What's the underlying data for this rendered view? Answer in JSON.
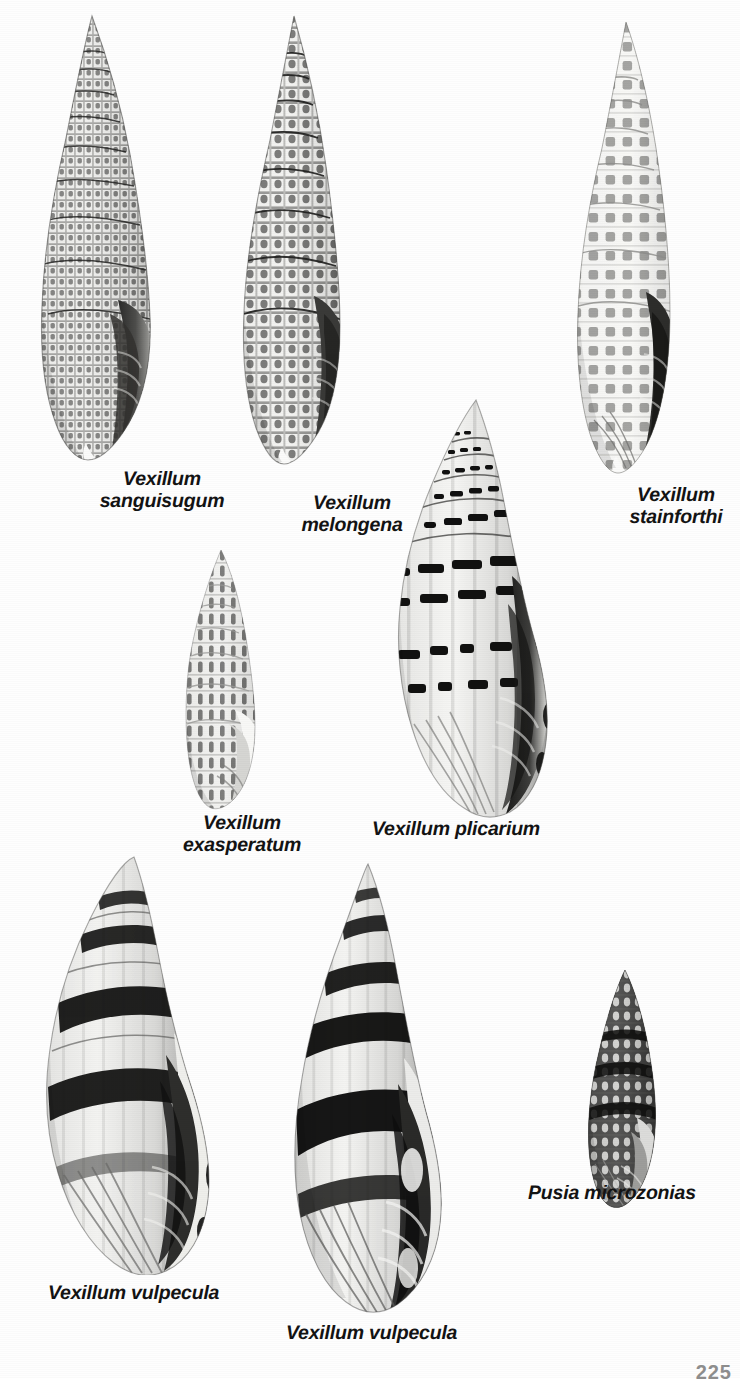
{
  "plate": {
    "background_color": "#fefefe",
    "ink_color": "#131313",
    "page_number": "225",
    "kind": "illustrated-plate"
  },
  "specimens": [
    {
      "id": "vexillum-sanguisugum",
      "caption": "Vexillum\nsanguisugum",
      "genus": "Vexillum",
      "species": "sanguisugum",
      "pattern": "fine-cancellate-grid",
      "shape": "elongate-fusiform",
      "x": 14,
      "y": 14,
      "w": 175,
      "h": 448,
      "caption_x": 62,
      "caption_y": 468,
      "caption_w": 200
    },
    {
      "id": "vexillum-melongena",
      "caption": "Vexillum\nmelongena",
      "genus": "Vexillum",
      "species": "melongena",
      "pattern": "bold-checker-spiral",
      "shape": "elongate-fusiform",
      "x": 218,
      "y": 14,
      "w": 160,
      "h": 452,
      "caption_x": 252,
      "caption_y": 492,
      "caption_w": 200
    },
    {
      "id": "vexillum-stainforthi",
      "caption": "Vexillum\nstainforthi",
      "genus": "Vexillum",
      "species": "stainforthi",
      "pattern": "rectangular-blotches",
      "shape": "slender-turreted",
      "x": 552,
      "y": 20,
      "w": 158,
      "h": 455,
      "caption_x": 576,
      "caption_y": 484,
      "caption_w": 200
    },
    {
      "id": "vexillum-exasperatum",
      "caption": "Vexillum\nexasperatum",
      "genus": "Vexillum",
      "species": "exasperatum",
      "pattern": "axial-dark-streaks",
      "shape": "small-fusiform",
      "x": 163,
      "y": 548,
      "w": 120,
      "h": 262,
      "caption_x": 142,
      "caption_y": 812,
      "caption_w": 200
    },
    {
      "id": "vexillum-plicarium",
      "caption": "Vexillum plicarium",
      "genus": "Vexillum",
      "species": "plicarium",
      "pattern": "bold-spiral-dashes",
      "shape": "broad-fusiform",
      "x": 368,
      "y": 398,
      "w": 212,
      "h": 420,
      "caption_x": 372,
      "caption_y": 818,
      "caption_w": 230
    },
    {
      "id": "vexillum-vulpecula-left",
      "caption": "Vexillum vulpecula",
      "genus": "Vexillum",
      "species": "vulpecula",
      "pattern": "broad-black-bands",
      "shape": "large-fusiform",
      "x": 6,
      "y": 855,
      "w": 240,
      "h": 420,
      "caption_x": 48,
      "caption_y": 1282,
      "caption_w": 230
    },
    {
      "id": "vexillum-vulpecula-right",
      "caption": "Vexillum vulpecula",
      "genus": "Vexillum",
      "species": "vulpecula",
      "pattern": "broad-black-bands",
      "shape": "large-fusiform",
      "x": 262,
      "y": 862,
      "w": 218,
      "h": 452,
      "caption_x": 286,
      "caption_y": 1322,
      "caption_w": 230
    },
    {
      "id": "pusia-microzonias",
      "caption": "Pusia microzonias",
      "genus": "Pusia",
      "species": "microzonias",
      "pattern": "dark-with-white-specks",
      "shape": "small-ovate-fusiform",
      "x": 567,
      "y": 968,
      "w": 110,
      "h": 240,
      "caption_x": 528,
      "caption_y": 1182,
      "caption_w": 220
    }
  ]
}
